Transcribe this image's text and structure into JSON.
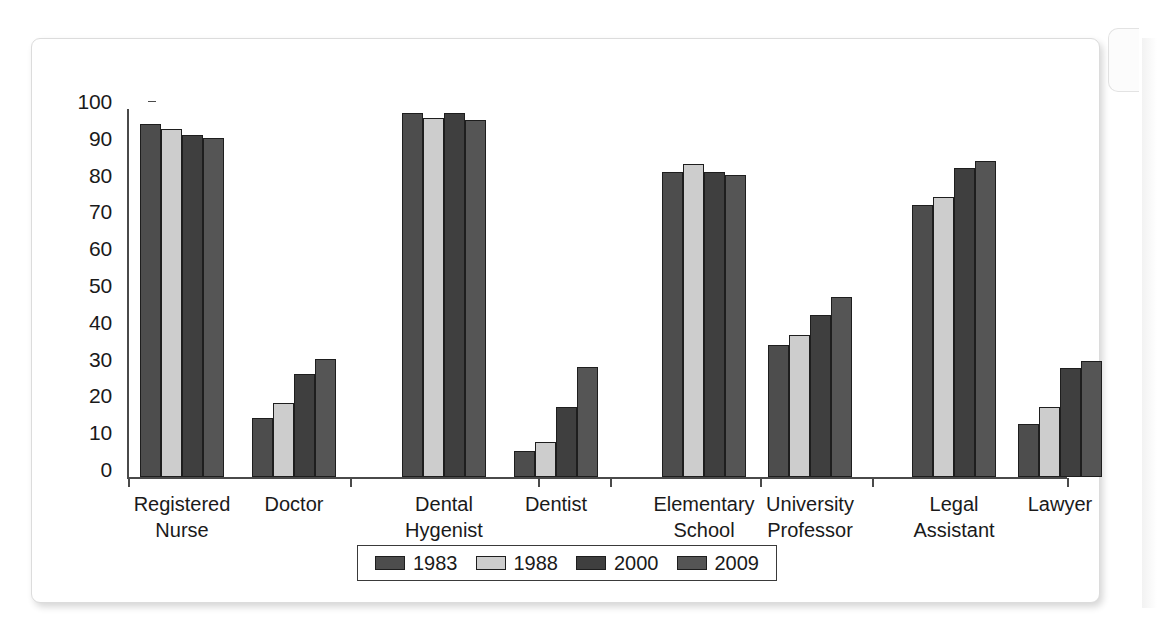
{
  "chart_data": {
    "type": "bar",
    "title": "",
    "xlabel": "",
    "ylabel": "",
    "ylim": [
      0,
      100
    ],
    "yticks": [
      0,
      10,
      20,
      30,
      40,
      50,
      60,
      70,
      80,
      90,
      100
    ],
    "grid": false,
    "legend_position": "bottom",
    "categories": [
      "Registered\nNurse",
      "Doctor",
      "Dental\nHygenist",
      "Dentist",
      "Elementary\nSchool\nTeacher",
      "University\nProfessor",
      "Legal\nAssistant",
      "Lawyer"
    ],
    "series": [
      {
        "name": "1983",
        "color": "#4d4d4d",
        "values": [
          96,
          16,
          99,
          7,
          83,
          36,
          74,
          14.5
        ]
      },
      {
        "name": "1988",
        "color": "#cdcdcd",
        "values": [
          94.5,
          20,
          97.5,
          9.5,
          85,
          38.5,
          76,
          19
        ]
      },
      {
        "name": "2000",
        "color": "#3f3f3f",
        "values": [
          93,
          28,
          99,
          19,
          83,
          44,
          84,
          29.5
        ]
      },
      {
        "name": "2009",
        "color": "#555555",
        "values": [
          92,
          32,
          97,
          30,
          82,
          49,
          86,
          31.5
        ]
      }
    ]
  },
  "legend": {
    "items": [
      {
        "label": "1983"
      },
      {
        "label": "1988"
      },
      {
        "label": "2000"
      },
      {
        "label": "2009"
      }
    ]
  }
}
